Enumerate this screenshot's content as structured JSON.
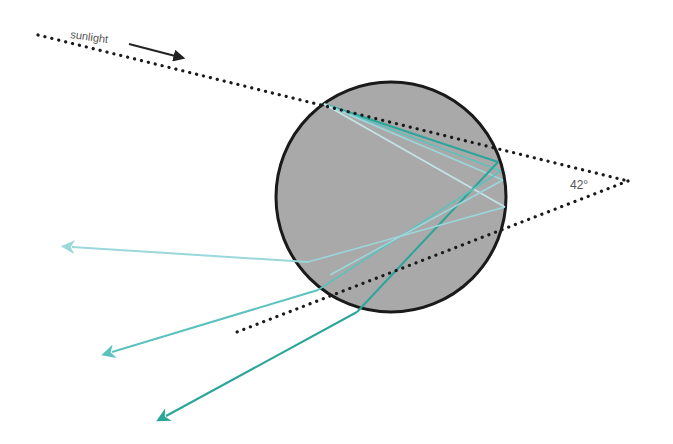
{
  "diagram": {
    "labels": {
      "sunlight": "sunlight",
      "angle": "42°"
    },
    "colors": {
      "background": "#ffffff",
      "drop_fill": "#a9a9a9",
      "drop_stroke": "#1a1a1a",
      "dotted_line": "#1a1a1a",
      "ray_dark": "#2aa59a",
      "ray_mid": "#5cc2bd",
      "ray_light": "#9ad8dc",
      "arrow": "#222222"
    },
    "drop": {
      "cx": 391,
      "cy": 197,
      "r": 115
    },
    "incoming_ray": {
      "x1": 38,
      "y1": 35,
      "x2": 628,
      "y2": 181
    },
    "outgoing_ray": {
      "x1": 628,
      "y1": 181,
      "x2": 237,
      "y2": 332
    },
    "exit_rays": [
      {
        "name": "light",
        "x1": 308,
        "y1": 262,
        "x2": 68,
        "y2": 247
      },
      {
        "name": "mid",
        "x1": 318,
        "y1": 290,
        "x2": 108,
        "y2": 353
      },
      {
        "name": "dark",
        "x1": 357,
        "y1": 312,
        "x2": 162,
        "y2": 418
      }
    ]
  }
}
